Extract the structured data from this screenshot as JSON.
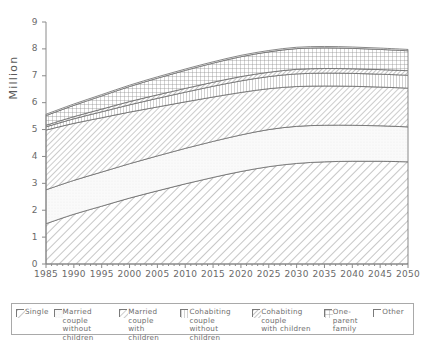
{
  "chart_data": {
    "type": "area",
    "title": "",
    "xlabel": "",
    "ylabel": "Million",
    "xlim": [
      1985,
      2050
    ],
    "ylim": [
      0,
      9
    ],
    "yticks": [
      0,
      1,
      2,
      3,
      4,
      5,
      6,
      7,
      8,
      9
    ],
    "xticks": [
      1985,
      1990,
      1995,
      2000,
      2005,
      2010,
      2015,
      2020,
      2025,
      2030,
      2035,
      2040,
      2045,
      2050
    ],
    "minor_xtick_step": 1,
    "grid": false,
    "stacked": true,
    "legend_position": "bottom",
    "x": [
      1985,
      1990,
      1995,
      2000,
      2005,
      2010,
      2015,
      2020,
      2025,
      2030,
      2035,
      2040,
      2045,
      2050
    ],
    "series": [
      {
        "name": "Single",
        "pattern": "diagonal-hatch",
        "values": [
          1.5,
          1.85,
          2.15,
          2.45,
          2.72,
          2.98,
          3.22,
          3.44,
          3.62,
          3.74,
          3.8,
          3.82,
          3.82,
          3.8
        ]
      },
      {
        "name": "Married couple without children",
        "pattern": "fine-dots",
        "values": [
          1.26,
          1.26,
          1.27,
          1.28,
          1.3,
          1.32,
          1.34,
          1.36,
          1.38,
          1.38,
          1.36,
          1.34,
          1.32,
          1.3
        ]
      },
      {
        "name": "Married couple with children",
        "pattern": "diagonal-hatch-dense",
        "values": [
          2.22,
          2.12,
          2.02,
          1.92,
          1.82,
          1.73,
          1.65,
          1.58,
          1.52,
          1.48,
          1.46,
          1.45,
          1.44,
          1.44
        ]
      },
      {
        "name": "Cohabiting couple without children",
        "pattern": "vertical-hatch",
        "values": [
          0.12,
          0.17,
          0.22,
          0.27,
          0.32,
          0.36,
          0.4,
          0.43,
          0.45,
          0.47,
          0.48,
          0.48,
          0.48,
          0.48
        ]
      },
      {
        "name": "Cohabiting couple with children",
        "pattern": "narrow-diagonal",
        "values": [
          0.06,
          0.08,
          0.1,
          0.12,
          0.13,
          0.14,
          0.15,
          0.16,
          0.16,
          0.17,
          0.17,
          0.17,
          0.17,
          0.17
        ]
      },
      {
        "name": "One-parent family",
        "pattern": "cross-hatch",
        "values": [
          0.36,
          0.42,
          0.49,
          0.56,
          0.62,
          0.67,
          0.71,
          0.74,
          0.76,
          0.77,
          0.77,
          0.76,
          0.75,
          0.74
        ]
      },
      {
        "name": "Other",
        "pattern": "blank",
        "values": [
          0.05,
          0.05,
          0.05,
          0.05,
          0.05,
          0.05,
          0.05,
          0.05,
          0.05,
          0.05,
          0.05,
          0.05,
          0.05,
          0.05
        ]
      }
    ],
    "totals": [
      5.57,
      5.95,
      6.3,
      6.65,
      6.96,
      7.25,
      7.52,
      7.76,
      7.94,
      8.06,
      8.09,
      8.07,
      8.03,
      7.98
    ]
  },
  "axes": {
    "y_label": "Million",
    "y_ticks": [
      "0",
      "1",
      "2",
      "3",
      "4",
      "5",
      "6",
      "7",
      "8",
      "9"
    ],
    "x_ticks": [
      "1985",
      "1990",
      "1995",
      "2000",
      "2005",
      "2010",
      "2015",
      "2020",
      "2025",
      "2030",
      "2035",
      "2040",
      "2045",
      "2050"
    ]
  },
  "legend": {
    "entries": [
      {
        "label": "Single",
        "sub": "",
        "pattern": "diagonal-hatch"
      },
      {
        "label": "Married couple",
        "sub": "without children",
        "pattern": "fine-dots"
      },
      {
        "label": "Married couple",
        "sub": "with children",
        "pattern": "diagonal-hatch-dense"
      },
      {
        "label": "Cohabiting couple",
        "sub": "without children",
        "pattern": "vertical-hatch"
      },
      {
        "label": "Cohabiting couple",
        "sub": "with children",
        "pattern": "narrow-diagonal"
      },
      {
        "label": "One-parent",
        "sub": "family",
        "pattern": "cross-hatch"
      },
      {
        "label": "Other",
        "sub": "",
        "pattern": "blank"
      }
    ]
  },
  "colors": {
    "line": "#6b6b6b",
    "axis": "#8a8a8a",
    "text": "#6a6a6a",
    "legend_border": "#a9a9a9",
    "background": "#ffffff"
  }
}
